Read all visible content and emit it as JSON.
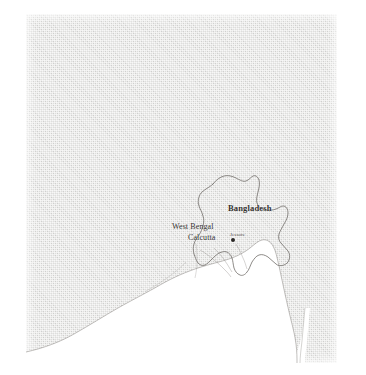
{
  "map": {
    "type": "political-reference-map",
    "region": "Bangladesh and West Bengal, Ganges delta",
    "style": "scanned grayscale halftone",
    "colors": {
      "land": "#dededc",
      "sea": "#ffffff",
      "border_line": "#6e6a66",
      "coastline": "#7a7672",
      "label_text": "#33312f",
      "page_background": "#ffffff"
    },
    "labels": {
      "country": "Bangladesh",
      "state": "West Bengal",
      "city_primary": "Calcutta",
      "city_secondary": "Jessore"
    },
    "markers": [
      {
        "name": "Calcutta",
        "symbol": "filled-dot"
      }
    ],
    "water_body": "Bay of Bengal",
    "plate": {
      "left": 26,
      "top": 14,
      "width": 311,
      "height": 349
    }
  }
}
